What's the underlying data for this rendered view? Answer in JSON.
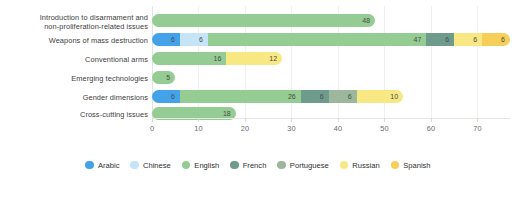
{
  "chart_data": {
    "type": "bar",
    "orientation": "horizontal",
    "stacked": true,
    "title": "",
    "subtitle": "",
    "xlabel": "",
    "ylabel": "",
    "xlim": [
      0,
      77
    ],
    "grid": true,
    "legend_position": "bottom",
    "xticks": [
      0,
      10,
      20,
      30,
      40,
      50,
      60,
      70
    ],
    "xtick_labels": [
      "0",
      "10",
      "20",
      "30",
      "40",
      "50",
      "60",
      "70"
    ],
    "categories": [
      "Introduction to disarmament and non-proliferation-related issues",
      "Weapons of mass destruction",
      "Conventional arms",
      "Emerging technologies",
      "Gender dimensions",
      "Cross-cutting issues"
    ],
    "series": [
      {
        "name": "Arabic",
        "color": "#44a3e8",
        "values": [
          0,
          6,
          0,
          0,
          6,
          0
        ]
      },
      {
        "name": "Chinese",
        "color": "#c5e4f5",
        "values": [
          0,
          6,
          0,
          0,
          0,
          0
        ]
      },
      {
        "name": "English",
        "color": "#94cc94",
        "values": [
          48,
          47,
          16,
          5,
          26,
          18
        ]
      },
      {
        "name": "French",
        "color": "#6f9b8d",
        "values": [
          0,
          6,
          0,
          0,
          6,
          0
        ]
      },
      {
        "name": "Portuguese",
        "color": "#9db79d",
        "values": [
          0,
          0,
          0,
          0,
          6,
          0
        ]
      },
      {
        "name": "Russian",
        "color": "#f7e883",
        "values": [
          0,
          6,
          12,
          0,
          10,
          0
        ]
      },
      {
        "name": "Spanish",
        "color": "#f5cf59",
        "values": [
          0,
          6,
          0,
          0,
          0,
          0
        ]
      }
    ]
  },
  "categories_display": [
    {
      "line1": "Introduction to disarmament and",
      "line2": "non-proliferation-related issues"
    },
    {
      "line1": "Weapons of mass destruction",
      "line2": ""
    },
    {
      "line1": "Conventional arms",
      "line2": ""
    },
    {
      "line1": "Emerging technologies",
      "line2": ""
    },
    {
      "line1": "Gender dimensions",
      "line2": ""
    },
    {
      "line1": "Cross-cutting issues",
      "line2": ""
    }
  ]
}
